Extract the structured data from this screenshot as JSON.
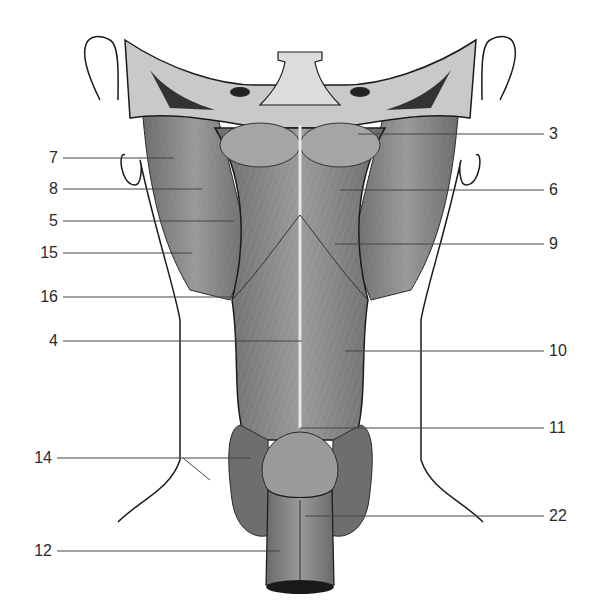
{
  "figure": {
    "colors": {
      "muscle": "#8e8e8e",
      "muscle_dark": "#555555",
      "bone": "#c9c9c9",
      "thyroid": "#6e6e6e",
      "outline": "#1a1a1a",
      "leader": "#444444"
    }
  },
  "labels": {
    "left": [
      {
        "id": "7",
        "text": "7",
        "y": 158,
        "tx": 174
      },
      {
        "id": "8",
        "text": "8",
        "y": 189,
        "tx": 202
      },
      {
        "id": "5",
        "text": "5",
        "y": 221,
        "tx": 234
      },
      {
        "id": "15",
        "text": "15",
        "y": 253,
        "tx": 192
      },
      {
        "id": "16",
        "text": "16",
        "y": 297,
        "tx": 234
      },
      {
        "id": "4",
        "text": "4",
        "y": 341,
        "tx": 302
      },
      {
        "id": "14",
        "text": "14",
        "y": 458,
        "tx": 250
      },
      {
        "id": "12",
        "text": "12",
        "y": 551,
        "tx": 280
      }
    ],
    "right": [
      {
        "id": "3",
        "text": "3",
        "y": 134,
        "tx": 358
      },
      {
        "id": "6",
        "text": "6",
        "y": 190,
        "tx": 340
      },
      {
        "id": "9",
        "text": "9",
        "y": 244,
        "tx": 335
      },
      {
        "id": "10",
        "text": "10",
        "y": 351,
        "tx": 345
      },
      {
        "id": "11",
        "text": "11",
        "y": 428,
        "tx": 300
      },
      {
        "id": "22",
        "text": "22",
        "y": 516,
        "tx": 305
      }
    ]
  }
}
